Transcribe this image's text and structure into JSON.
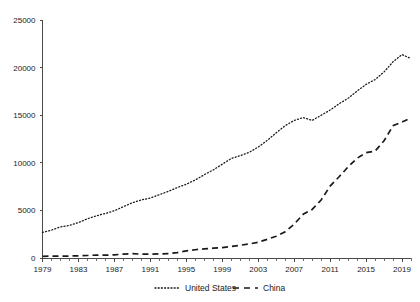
{
  "chart_data": {
    "type": "line",
    "title": "",
    "subtitle": "",
    "xlabel": "",
    "ylabel": "",
    "xlim": [
      1979,
      2020
    ],
    "ylim": [
      0,
      25000
    ],
    "grid": false,
    "legend_position": "bottom-center",
    "y_ticks": [
      0,
      5000,
      10000,
      15000,
      20000,
      25000
    ],
    "y_tick_labels": [
      "0",
      "5000",
      "10000",
      "15000",
      "20000",
      "25000"
    ],
    "x_ticks": [
      1979,
      1983,
      1987,
      1991,
      1995,
      1999,
      2003,
      2007,
      2011,
      2015,
      2019
    ],
    "x_tick_labels": [
      "1979",
      "1983",
      "1987",
      "1991",
      "1995",
      "1999",
      "2003",
      "2007",
      "2011",
      "2015",
      "2019"
    ],
    "x_minor_tick_step": 1,
    "x": [
      1979,
      1980,
      1981,
      1982,
      1983,
      1984,
      1985,
      1986,
      1987,
      1988,
      1989,
      1990,
      1991,
      1992,
      1993,
      1994,
      1995,
      1996,
      1997,
      1998,
      1999,
      2000,
      2001,
      2002,
      2003,
      2004,
      2005,
      2006,
      2007,
      2008,
      2009,
      2010,
      2011,
      2012,
      2013,
      2014,
      2015,
      2016,
      2017,
      2018,
      2019,
      2020
    ],
    "series": [
      {
        "name": "United States",
        "line_style": "dotted",
        "color": "#1a1a1a",
        "values": [
          2700,
          2930,
          3270,
          3420,
          3720,
          4120,
          4430,
          4680,
          4970,
          5390,
          5800,
          6100,
          6300,
          6650,
          7000,
          7400,
          7750,
          8200,
          8750,
          9250,
          9850,
          10450,
          10750,
          11100,
          11650,
          12350,
          13150,
          13900,
          14450,
          14750,
          14450,
          14990,
          15540,
          16200,
          16780,
          17530,
          18240,
          18740,
          19540,
          20610,
          21370,
          20940
        ]
      },
      {
        "name": "China",
        "line_style": "dashed",
        "color": "#1a1a1a",
        "values": [
          180,
          190,
          200,
          205,
          230,
          260,
          310,
          300,
          330,
          410,
          460,
          400,
          400,
          430,
          450,
          570,
          740,
          870,
          960,
          1030,
          1090,
          1210,
          1340,
          1470,
          1660,
          1960,
          2290,
          2750,
          3550,
          4590,
          5100,
          6090,
          7550,
          8530,
          9570,
          10480,
          11060,
          11230,
          12310,
          13890,
          14280,
          14720
        ]
      }
    ],
    "legend": [
      {
        "label": "United States",
        "style": "dotted"
      },
      {
        "label": "China",
        "style": "dashed"
      }
    ]
  }
}
